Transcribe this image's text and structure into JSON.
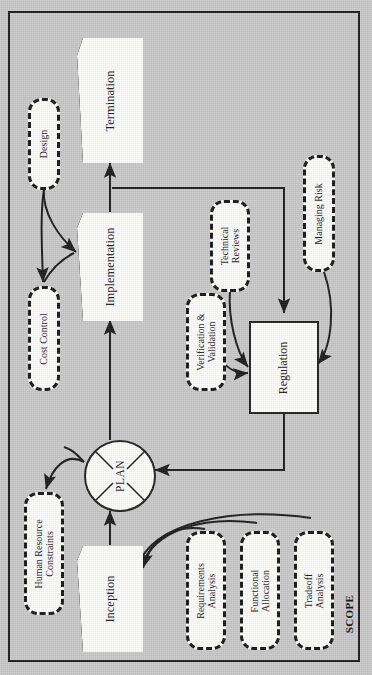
{
  "diagram": {
    "frame_label": "SCOPE",
    "background_color": "#c9c9c9",
    "line_color": "#1a1a1a",
    "node_fill": "#fdfdfb",
    "orientation": "rotated-90-ccw",
    "process_nodes": [
      {
        "id": "termination",
        "label": "Termination",
        "shape": "pentagon"
      },
      {
        "id": "implementation",
        "label": "Implementation",
        "shape": "pentagon"
      },
      {
        "id": "plan",
        "label": "PLAN",
        "shape": "circle-x"
      },
      {
        "id": "regulation",
        "label": "Regulation",
        "shape": "rectangle"
      },
      {
        "id": "inception",
        "label": "Inception",
        "shape": "pentagon"
      }
    ],
    "annotation_nodes": [
      {
        "id": "design",
        "label": "Design",
        "shape": "dashed-rounded"
      },
      {
        "id": "cost_control",
        "label": "Cost Control",
        "shape": "dashed-rounded"
      },
      {
        "id": "human_resource",
        "label": "Human Resource\nConstraints",
        "line1": "Human Resource",
        "line2": "Constraints",
        "shape": "dashed-rounded"
      },
      {
        "id": "verification",
        "label": "Verification &\nValidation",
        "line1": "Verification &",
        "line2": "Validation",
        "shape": "dashed-rounded"
      },
      {
        "id": "technical_reviews",
        "label": "Technical\nReviews",
        "line1": "Technical",
        "line2": "Reviews",
        "shape": "dashed-rounded"
      },
      {
        "id": "managing_risk",
        "label": "Managing Risk",
        "shape": "dashed-rounded"
      },
      {
        "id": "requirements_analysis",
        "label": "Requirements\nAnalysis",
        "line1": "Requirements",
        "line2": "Analysis",
        "shape": "dashed-rounded"
      },
      {
        "id": "functional_allocation",
        "label": "Functional\nAllocation",
        "line1": "Functional",
        "line2": "Allocation",
        "shape": "dashed-rounded"
      },
      {
        "id": "tradeoff_analysis",
        "label": "Tradeoff\nAnalysis",
        "line1": "Tradeoff",
        "line2": "Analysis",
        "shape": "dashed-rounded"
      }
    ],
    "connections": [
      {
        "from": "inception",
        "to": "plan",
        "style": "straight-arrow"
      },
      {
        "from": "plan",
        "to": "implementation",
        "style": "straight-arrow"
      },
      {
        "from": "implementation",
        "to": "termination",
        "style": "straight-arrow"
      },
      {
        "from": "implementation",
        "to": "regulation",
        "style": "orthogonal-arrow"
      },
      {
        "from": "regulation",
        "to": "plan",
        "style": "orthogonal-arrow"
      },
      {
        "from": "design",
        "to": "implementation",
        "style": "curved-arrow"
      },
      {
        "from": "design",
        "to": "cost_control",
        "style": "curved-arrow"
      },
      {
        "from": "cost_control",
        "to": "implementation",
        "style": "curved-arrow"
      },
      {
        "from": "plan",
        "to": "human_resource",
        "style": "curved-arrow"
      },
      {
        "from": "verification",
        "to": "regulation",
        "style": "curved-arrow"
      },
      {
        "from": "technical_reviews",
        "to": "regulation",
        "style": "curved-arrow"
      },
      {
        "from": "managing_risk",
        "to": "regulation",
        "style": "curved-arrow"
      },
      {
        "from": "requirements_analysis",
        "to": "inception",
        "style": "curved-arrow"
      },
      {
        "from": "functional_allocation",
        "to": "inception",
        "style": "curved-arrow"
      },
      {
        "from": "tradeoff_analysis",
        "to": "inception",
        "style": "curved-arrow"
      }
    ]
  }
}
